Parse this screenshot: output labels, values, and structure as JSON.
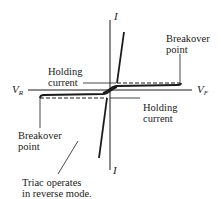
{
  "diagram": {
    "axes": {
      "vertical_top_label": "I",
      "vertical_bottom_label": "I",
      "horizontal_left_label_base": "V",
      "horizontal_left_label_sub": "R",
      "horizontal_right_label_base": "V",
      "horizontal_right_label_sub": "F"
    },
    "annotations": {
      "breakover_forward": [
        "Breakover",
        "point"
      ],
      "holding_forward": [
        "Holding",
        "current"
      ],
      "holding_reverse": [
        "Holding",
        "current"
      ],
      "breakover_reverse": [
        "Breakover",
        "point"
      ],
      "reverse_mode_note": [
        "Triac operates",
        "in reverse mode."
      ]
    },
    "colors": {
      "line": "#1a1a1a",
      "background": "#ffffff"
    }
  }
}
